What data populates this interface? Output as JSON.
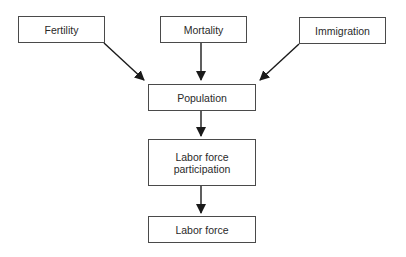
{
  "diagram": {
    "type": "flowchart",
    "nodes": {
      "fertility": {
        "label": "Fertility"
      },
      "mortality": {
        "label": "Mortality"
      },
      "immigration": {
        "label": "Immigration"
      },
      "population": {
        "label": "Population"
      },
      "labor_force_participation": {
        "label_line1": "Labor force",
        "label_line2": "participation"
      },
      "labor_force": {
        "label": "Labor force"
      }
    },
    "edges": [
      {
        "from": "Fertility",
        "to": "Population"
      },
      {
        "from": "Mortality",
        "to": "Population"
      },
      {
        "from": "Immigration",
        "to": "Population"
      },
      {
        "from": "Population",
        "to": "Labor force participation"
      },
      {
        "from": "Labor force participation",
        "to": "Labor force"
      }
    ],
    "colors": {
      "stroke": "#4a4a4a",
      "arrow": "#1a1a1a",
      "text": "#2a2a2a",
      "background": "#ffffff"
    }
  }
}
